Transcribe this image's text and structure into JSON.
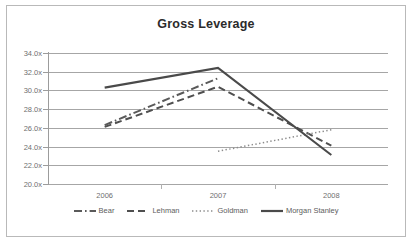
{
  "chart_data": {
    "type": "line",
    "title": "Gross Leverage",
    "xlabel": "",
    "ylabel": "",
    "x": [
      "2006",
      "2007",
      "2008"
    ],
    "categories": [
      "2006",
      "2007",
      "2008"
    ],
    "ylim": [
      20.0,
      34.0
    ],
    "ytick_step": 2.0,
    "ytick_labels": [
      "34.0x",
      "32.0x",
      "30.0x",
      "28.0x",
      "26.0x",
      "24.0x",
      "22.0x",
      "20.0x"
    ],
    "ytick_values": [
      34.0,
      32.0,
      30.0,
      28.0,
      26.0,
      24.0,
      22.0,
      20.0
    ],
    "xtick_labels": [
      "2006",
      "2007",
      "2008"
    ],
    "grid": true,
    "grid_axis": "y",
    "legend_position": "bottom",
    "series": [
      {
        "name": "Bear",
        "style": "dash-dot",
        "color": "#5a5a5a",
        "x": [
          "2006",
          "2007"
        ],
        "values": [
          26.3,
          31.3
        ]
      },
      {
        "name": "Lehman",
        "style": "dashed",
        "color": "#4f4f4f",
        "x": [
          "2006",
          "2007",
          "2008"
        ],
        "values": [
          26.1,
          30.4,
          24.1
        ]
      },
      {
        "name": "Goldman",
        "style": "dotted",
        "color": "#8c8c8c",
        "x": [
          "2007",
          "2008"
        ],
        "values": [
          23.5,
          25.8
        ]
      },
      {
        "name": "Morgan Stanley",
        "style": "solid",
        "color": "#4a4a4a",
        "x": [
          "2006",
          "2007",
          "2008"
        ],
        "values": [
          30.3,
          32.4,
          23.1
        ]
      }
    ]
  },
  "legend": {
    "items": [
      {
        "label": "Bear"
      },
      {
        "label": "Lehman"
      },
      {
        "label": "Goldman"
      },
      {
        "label": "Morgan Stanley"
      }
    ]
  }
}
